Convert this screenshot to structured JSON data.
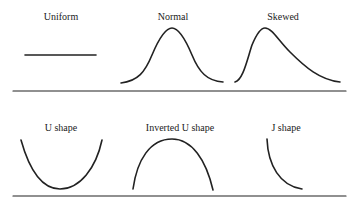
{
  "diagram": {
    "stroke_color": "#222222",
    "rows": [
      {
        "panels": [
          {
            "label": "Uniform",
            "shape": "uniform"
          },
          {
            "label": "Normal",
            "shape": "normal"
          },
          {
            "label": "Skewed",
            "shape": "skewed"
          }
        ]
      },
      {
        "panels": [
          {
            "label": "U shape",
            "shape": "u"
          },
          {
            "label": "Inverted U shape",
            "shape": "inverted-u"
          },
          {
            "label": "J shape",
            "shape": "j"
          }
        ]
      }
    ]
  }
}
